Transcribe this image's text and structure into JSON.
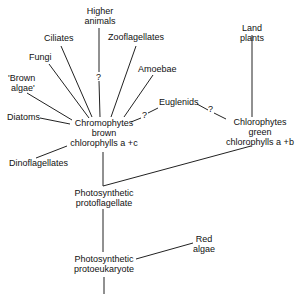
{
  "diagram": {
    "type": "phylogenetic tree",
    "nodes": {
      "higher_animals": [
        "Higher",
        "animals"
      ],
      "ciliates": "Ciliates",
      "zooflagellates": "Zooflagellates",
      "fungi": "Fungi",
      "amoebae": "Amoebae",
      "brown_algae": [
        "'Brown",
        "algae'"
      ],
      "diatoms": "Diatoms",
      "chromophytes": [
        "Chromophytes",
        "brown",
        "chlorophylls a +c"
      ],
      "euglenids": "Euglenids",
      "land_plants": [
        "Land",
        "plants"
      ],
      "chlorophytes": [
        "Chlorophytes",
        "green",
        "chlorophylls a +b"
      ],
      "dinoflagellates": "Dinoflagellates",
      "protoflagellate": [
        "Photosynthetic",
        "protoflagellate"
      ],
      "red_algae": [
        "Red",
        "algae"
      ],
      "protoeukaryote": [
        "Photosynthetic",
        "protoeukaryote"
      ]
    },
    "question_marks": {
      "higher_animals_link": "?",
      "chromophytes_euglenids_link": "?",
      "euglenids_chlorophytes_link": "?"
    }
  }
}
